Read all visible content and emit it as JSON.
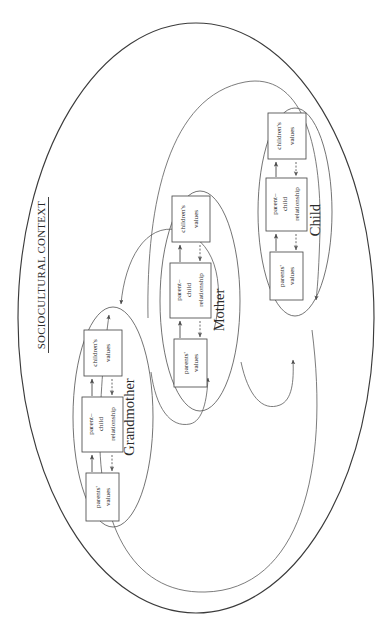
{
  "figure": {
    "title": "SOCIOCULTURAL CONTEXT",
    "orientation": "rotated-90-ccw",
    "colors": {
      "stroke_outer": "#3b3b3b",
      "stroke_inner": "#5a5a5a",
      "box_stroke": "#4a4a4a",
      "text": "#2b2b2b",
      "background": "#ffffff"
    }
  },
  "context": {
    "label": "SOCIOCULTURAL CONTEXT"
  },
  "generations": [
    {
      "id": "grandmother",
      "label": "Grandmother",
      "nodes": [
        {
          "id": "gm-parents-values",
          "line1": "parents'",
          "line2": "values"
        },
        {
          "id": "gm-pc-relationship",
          "line1": "parent–",
          "line2": "child",
          "line3": "relationship"
        },
        {
          "id": "gm-childrens-values",
          "line1": "children's",
          "line2": "values"
        }
      ],
      "arrows": [
        {
          "from": "gm-parents-values",
          "to": "gm-pc-relationship",
          "style": "solid"
        },
        {
          "from": "gm-pc-relationship",
          "to": "gm-parents-values",
          "style": "dashed"
        },
        {
          "from": "gm-pc-relationship",
          "to": "gm-childrens-values",
          "style": "solid"
        },
        {
          "from": "gm-childrens-values",
          "to": "gm-pc-relationship",
          "style": "dashed"
        }
      ]
    },
    {
      "id": "mother",
      "label": "Mother",
      "nodes": [
        {
          "id": "mo-parents-values",
          "line1": "parents'",
          "line2": "values"
        },
        {
          "id": "mo-pc-relationship",
          "line1": "parent–",
          "line2": "child",
          "line3": "relationship"
        },
        {
          "id": "mo-childrens-values",
          "line1": "children's",
          "line2": "values"
        }
      ],
      "arrows": [
        {
          "from": "mo-parents-values",
          "to": "mo-pc-relationship",
          "style": "solid"
        },
        {
          "from": "mo-pc-relationship",
          "to": "mo-parents-values",
          "style": "dashed"
        },
        {
          "from": "mo-pc-relationship",
          "to": "mo-childrens-values",
          "style": "solid"
        },
        {
          "from": "mo-childrens-values",
          "to": "mo-pc-relationship",
          "style": "dashed"
        }
      ]
    },
    {
      "id": "child",
      "label": "Child",
      "nodes": [
        {
          "id": "ch-parents-values",
          "line1": "parents'",
          "line2": "values"
        },
        {
          "id": "ch-pc-relationship",
          "line1": "parent–",
          "line2": "child",
          "line3": "relationship"
        },
        {
          "id": "ch-childrens-values",
          "line1": "children's",
          "line2": "values"
        }
      ],
      "arrows": [
        {
          "from": "ch-parents-values",
          "to": "ch-pc-relationship",
          "style": "solid"
        },
        {
          "from": "ch-pc-relationship",
          "to": "ch-parents-values",
          "style": "dashed"
        },
        {
          "from": "ch-pc-relationship",
          "to": "ch-childrens-values",
          "style": "solid"
        },
        {
          "from": "ch-childrens-values",
          "to": "ch-pc-relationship",
          "style": "dashed"
        }
      ]
    }
  ],
  "transmission_links": [
    {
      "id": "link-mother-to-grandmother-short",
      "from": "mother",
      "to": "grandmother",
      "description": "short curve from Mother generation back to Grandmother generation"
    },
    {
      "id": "link-child-to-grandmother-long",
      "from": "child",
      "to": "grandmother",
      "description": "long outer curve from Child generation back to Grandmother generation"
    },
    {
      "id": "link-grandmother-to-mother",
      "from": "grandmother",
      "to": "mother",
      "description": "curve from Grandmother generation into Mother generation"
    },
    {
      "id": "link-mother-to-child-short",
      "from": "mother",
      "to": "child",
      "description": "short curve from Mother generation into Child generation"
    },
    {
      "id": "link-grandmother-to-child-long",
      "from": "grandmother",
      "to": "child",
      "description": "long outer curve from Grandmother generation into Child generation"
    }
  ]
}
